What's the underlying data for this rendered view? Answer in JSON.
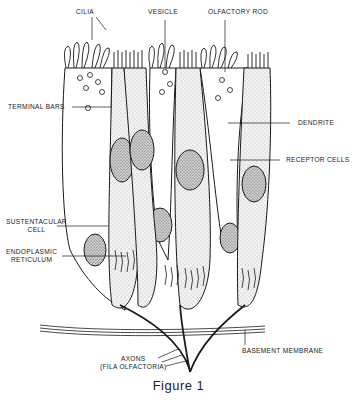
{
  "figure": {
    "caption": "Figure 1",
    "stroke_color": "#1a1a1a",
    "fill_color": "#e8e8e8"
  },
  "labels": {
    "cilia": "CILIA",
    "vesicle": "VESICLE",
    "olfactory_rod": "OLFACTORY ROD",
    "terminal_bars": "TERMINAL BARS",
    "dendrite": "DENDRITE",
    "receptor_cells": "RECEPTOR CELLS",
    "sustentacular_line1": "SUSTENTACULAR",
    "sustentacular_line2": "CELL",
    "endoplasmic_line1": "ENDOPLASMIC",
    "endoplasmic_line2": "RETICULUM",
    "axons_line1": "AXONS",
    "axons_line2": "(FILA OLFACTORIA)",
    "basement_membrane": "BASEMENT MEMBRANE"
  }
}
